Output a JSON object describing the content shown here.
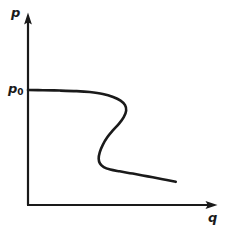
{
  "figure": {
    "background_color": "#ffffff",
    "stroke_color": "#1a1a1a",
    "axes": {
      "y_axis": {
        "name": "p-axis",
        "label": "p",
        "arrow": "arrow-up-icon"
      },
      "x_axis": {
        "name": "q-axis",
        "label": "q",
        "arrow": "arrow-right-icon"
      }
    },
    "annotations": {
      "p0_label_main": "p",
      "p0_label_sub": "0"
    }
  },
  "chart_data": {
    "type": "line",
    "title": "",
    "subtitle": "",
    "xlabel": "q",
    "ylabel": "p",
    "grid": false,
    "legend": null,
    "axis_style": "arrowed-lines",
    "xlim": [
      0,
      1
    ],
    "ylim": [
      0,
      1
    ],
    "tick_labels": {
      "x": [],
      "y": [
        "p0"
      ]
    },
    "annotations": [
      {
        "text": "p0",
        "axis": "y",
        "value": 0.615,
        "description": "plateau pressure level marked on p axis"
      }
    ],
    "series": [
      {
        "name": "p-q characteristic",
        "description": "S-shaped (N-shaped) non-monotonic curve starting at p0 on the pressure axis, running flat, folding back to the left, then descending to the right",
        "closed": false,
        "points": [
          {
            "q": 0.0,
            "p": 0.615
          },
          {
            "q": 0.08,
            "p": 0.614
          },
          {
            "q": 0.17,
            "p": 0.612
          },
          {
            "q": 0.26,
            "p": 0.609
          },
          {
            "q": 0.33,
            "p": 0.604
          },
          {
            "q": 0.4,
            "p": 0.594
          },
          {
            "q": 0.455,
            "p": 0.578
          },
          {
            "q": 0.495,
            "p": 0.558
          },
          {
            "q": 0.519,
            "p": 0.534
          },
          {
            "q": 0.525,
            "p": 0.505
          },
          {
            "q": 0.512,
            "p": 0.47
          },
          {
            "q": 0.487,
            "p": 0.435
          },
          {
            "q": 0.455,
            "p": 0.4
          },
          {
            "q": 0.424,
            "p": 0.362
          },
          {
            "q": 0.4,
            "p": 0.322
          },
          {
            "q": 0.384,
            "p": 0.283
          },
          {
            "q": 0.378,
            "p": 0.248
          },
          {
            "q": 0.385,
            "p": 0.222
          },
          {
            "q": 0.405,
            "p": 0.203
          },
          {
            "q": 0.44,
            "p": 0.19
          },
          {
            "q": 0.49,
            "p": 0.18
          },
          {
            "q": 0.56,
            "p": 0.168
          },
          {
            "q": 0.64,
            "p": 0.153
          },
          {
            "q": 0.72,
            "p": 0.138
          },
          {
            "q": 0.79,
            "p": 0.124
          }
        ]
      }
    ]
  }
}
